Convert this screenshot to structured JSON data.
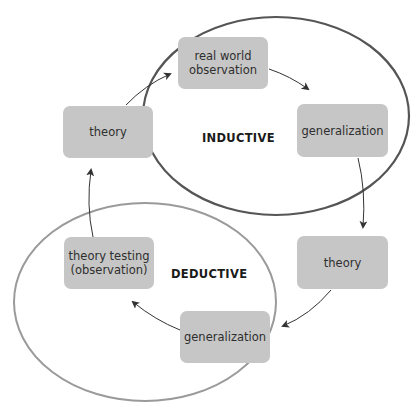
{
  "diagram": {
    "title": "",
    "colors": {
      "box_fill": "#c6c6c6",
      "inductive_ellipse": "#555555",
      "deductive_ellipse": "#9a9a9a",
      "arrow": "#333333",
      "text": "#2e2e2e"
    },
    "cycles": [
      {
        "id": "inductive",
        "label": "INDUCTIVE"
      },
      {
        "id": "deductive",
        "label": "DEDUCTIVE"
      }
    ],
    "nodes": [
      {
        "id": "real-world-observation",
        "line1": "real world",
        "line2": "observation"
      },
      {
        "id": "generalization-top",
        "line1": "generalization",
        "line2": ""
      },
      {
        "id": "theory-right",
        "line1": "theory",
        "line2": ""
      },
      {
        "id": "generalization-bottom",
        "line1": "generalization",
        "line2": ""
      },
      {
        "id": "theory-testing",
        "line1": "theory testing",
        "line2": "(observation)"
      },
      {
        "id": "theory-left",
        "line1": "theory",
        "line2": ""
      }
    ],
    "edges": [
      {
        "from": "real-world-observation",
        "to": "generalization-top"
      },
      {
        "from": "generalization-top",
        "to": "theory-right"
      },
      {
        "from": "theory-right",
        "to": "generalization-bottom"
      },
      {
        "from": "generalization-bottom",
        "to": "theory-testing"
      },
      {
        "from": "theory-testing",
        "to": "theory-left"
      },
      {
        "from": "theory-left",
        "to": "real-world-observation"
      }
    ]
  }
}
